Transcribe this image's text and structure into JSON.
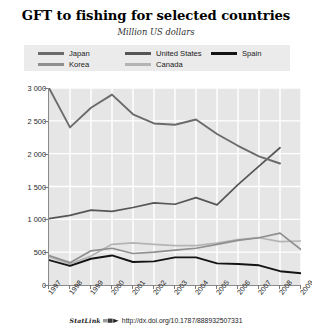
{
  "header": {
    "title": "GFT to fishing for selected countries",
    "subtitle": "Million US dollars"
  },
  "legend": {
    "japan": "Japan",
    "korea": "Korea",
    "united_states": "United States",
    "canada": "Canada",
    "spain": "Spain"
  },
  "footer": {
    "statlink_label": "StatLink",
    "url": "http://dx.doi.org/10.1787/888932507331"
  },
  "colors": {
    "japan": "#6b6b6b",
    "korea": "#8f8f8f",
    "united_states": "#565656",
    "canada": "#b4b4b4",
    "spain": "#141414",
    "plot_background": "#e6e6e6",
    "gridlines": "#ffffff",
    "legend_background": "#ebebeb",
    "axis": "#8a8a8a"
  },
  "chart_data": {
    "type": "line",
    "title": "GFT to fishing for selected countries",
    "subtitle": "Million US dollars",
    "xlabel": "",
    "ylabel": "Million US dollars",
    "x": [
      1997,
      1998,
      1999,
      2000,
      2001,
      2002,
      2003,
      2004,
      2005,
      2006,
      2007,
      2008,
      2009
    ],
    "xtick_labels": [
      "1997",
      "1998",
      "1999",
      "2000",
      "2001",
      "2002",
      "2003",
      "2004",
      "2005",
      "2006",
      "2007",
      "2008",
      "2009"
    ],
    "ytick_labels": [
      "0",
      "500",
      "1 000",
      "1 500",
      "2 000",
      "2 500",
      "3 000"
    ],
    "ytick_values": [
      0,
      500,
      1000,
      1500,
      2000,
      2500,
      3000
    ],
    "ylim": [
      0,
      3000
    ],
    "grid": true,
    "legend_position": "top",
    "series": [
      {
        "name": "Japan",
        "color": "#6b6b6b",
        "values": [
          3000,
          2400,
          2700,
          2900,
          2600,
          2460,
          2440,
          2520,
          2300,
          2120,
          1960,
          1850,
          null
        ]
      },
      {
        "name": "United States",
        "color": "#565656",
        "values": [
          1010,
          1060,
          1140,
          1120,
          1180,
          1250,
          1230,
          1330,
          1220,
          1530,
          1810,
          2090,
          null
        ]
      },
      {
        "name": "Korea",
        "color": "#8f8f8f",
        "values": [
          450,
          340,
          520,
          560,
          480,
          500,
          530,
          560,
          620,
          680,
          720,
          790,
          540
        ]
      },
      {
        "name": "Canada",
        "color": "#b4b4b4",
        "values": [
          430,
          320,
          440,
          620,
          640,
          620,
          600,
          600,
          640,
          690,
          720,
          660,
          670
        ]
      },
      {
        "name": "Spain",
        "color": "#141414",
        "values": [
          380,
          290,
          400,
          450,
          350,
          360,
          420,
          420,
          330,
          320,
          300,
          210,
          180
        ]
      }
    ]
  }
}
